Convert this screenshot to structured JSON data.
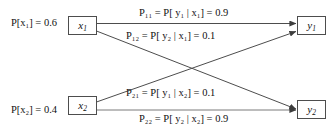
{
  "diagram": {
    "background_color": "#ffffff",
    "line_color": "#4d4d4d",
    "text_color": "#111111",
    "input_nodes": [
      {
        "id": "x1",
        "symbol": "x",
        "subscript": "1",
        "label": "x1"
      },
      {
        "id": "x2",
        "symbol": "x",
        "subscript": "2",
        "label": "x2"
      }
    ],
    "output_nodes": [
      {
        "id": "y1",
        "symbol": "y",
        "subscript": "1",
        "label": "y1"
      },
      {
        "id": "y2",
        "symbol": "y",
        "subscript": "2",
        "label": "y2"
      }
    ],
    "priors": [
      {
        "id": "prior-x1",
        "name": "P[x1]",
        "text": "P[x₁] = 0.6",
        "value": 0.6
      },
      {
        "id": "prior-x2",
        "name": "P[x2]",
        "text": "P[x₂] = 0.4",
        "value": 0.4
      }
    ],
    "edges": [
      {
        "id": "edge-x1-y1",
        "from": "x1",
        "to": "y1",
        "name": "P11",
        "text": "P₁₁ = P[ y₁ | x₁] = 0.9",
        "value": 0.9
      },
      {
        "id": "edge-x1-y2",
        "from": "x1",
        "to": "y2",
        "name": "P12",
        "text": "P₁₂ = P[ y₂ | x₁] = 0.1",
        "value": 0.1
      },
      {
        "id": "edge-x2-y1",
        "from": "x2",
        "to": "y1",
        "name": "P21",
        "text": "P₂₁ = P[ y₁ | x₂] = 0.1",
        "value": 0.1
      },
      {
        "id": "edge-x2-y2",
        "from": "x2",
        "to": "y2",
        "name": "P22",
        "text": "P₂₂ = P[ y₂ | x₂] = 0.9",
        "value": 0.9
      }
    ]
  }
}
